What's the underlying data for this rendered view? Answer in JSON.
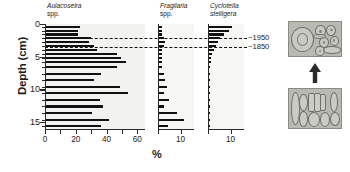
{
  "figure": {
    "y_axis_label": "Depth (cm)",
    "x_axis_label": "%",
    "depth_ticks": [
      0,
      5,
      10,
      15
    ],
    "depth_range": [
      0,
      16.2
    ]
  },
  "annotations": {
    "dash_top_label": "~1950",
    "dash_bottom_label": "~1850",
    "dash_top_depth": 2.1,
    "dash_bottom_depth": 3.5
  },
  "micrographs": {
    "top_caption": "",
    "bottom_caption": "",
    "arrow_icon": "arrow-up-icon",
    "top_label": "recent-sediment-micrograph",
    "bottom_label": "older-sediment-micrograph"
  },
  "chart_data": {
    "type": "bar",
    "title": "",
    "xlabel": "%",
    "ylabel": "Depth (cm)",
    "orientation": "horizontal",
    "y_inverted": true,
    "ylim": [
      0,
      16.2
    ],
    "ytick_labels": [
      "0",
      "5",
      "10",
      "15"
    ],
    "yticks": [
      0,
      5,
      10,
      15
    ],
    "depths": [
      0.4,
      1.0,
      1.6,
      2.2,
      2.8,
      3.4,
      4.0,
      4.6,
      5.2,
      5.8,
      6.6,
      7.6,
      8.6,
      9.6,
      10.6,
      11.6,
      12.6,
      13.6,
      14.6,
      15.6
    ],
    "panels": [
      {
        "name": "Aulacoseira spp.",
        "title_line1": "Aulacoseira",
        "title_line2": "spp.",
        "title_line1_italic": true,
        "title_line2_italic": false,
        "xlim": [
          0,
          65
        ],
        "xticks": [
          0,
          10,
          20,
          30,
          40,
          50,
          60
        ],
        "xtick_labels": [
          {
            "value": 0,
            "label": "0"
          },
          {
            "value": 20,
            "label": "20"
          },
          {
            "value": 40,
            "label": "40"
          },
          {
            "value": 60,
            "label": "60"
          }
        ],
        "values": [
          22,
          21,
          21,
          29,
          28,
          31,
          33,
          46,
          49,
          52,
          46,
          36,
          31,
          48,
          53,
          35,
          37,
          30,
          41,
          36
        ]
      },
      {
        "name": "Fragilaria spp.",
        "title_line1": "Fragilaria",
        "title_line2": "spp.",
        "title_line1_italic": true,
        "title_line2_italic": false,
        "xlim": [
          0,
          16
        ],
        "xticks": [
          0,
          10
        ],
        "xtick_labels": [
          {
            "value": 10,
            "label": "10"
          }
        ],
        "values": [
          1.5,
          1.5,
          1.5,
          2.0,
          2.5,
          2.0,
          1.5,
          1.5,
          1.5,
          1.5,
          1.5,
          2.0,
          2.5,
          3.5,
          2.0,
          4.5,
          2.0,
          8.0,
          11.0,
          4.0
        ]
      },
      {
        "name": "Cyclotella stelligera",
        "title_line1": "Cyclotella",
        "title_line2": "stelligera",
        "title_line1_italic": true,
        "title_line2_italic": true,
        "xlim": [
          0,
          16
        ],
        "xticks": [
          0,
          10
        ],
        "xtick_labels": [
          {
            "value": 10,
            "label": "10"
          }
        ],
        "values": [
          10.0,
          9.0,
          6.5,
          5.0,
          4.0,
          3.0,
          2.0,
          1.5,
          1.0,
          0.8,
          0.5,
          0.4,
          0.3,
          0.2,
          0.2,
          0.2,
          0.2,
          0.2,
          0.2,
          0.2
        ]
      }
    ]
  }
}
